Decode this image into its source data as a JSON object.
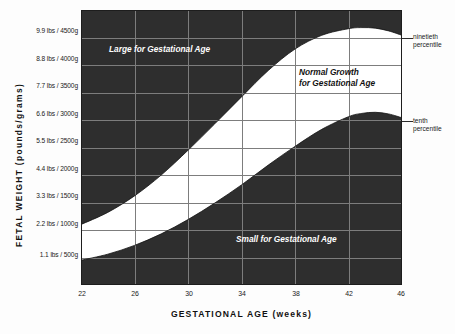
{
  "chart_data": {
    "type": "area",
    "title": "",
    "xlabel": "GESTATIONAL AGE (weeks)",
    "ylabel": "FETAL WEIGHT (pounds/grams)",
    "xlim": [
      22,
      46
    ],
    "ylim": [
      0,
      5000
    ],
    "grid": true,
    "legend_position": "right-annotations",
    "x_ticks": [
      22,
      26,
      30,
      34,
      38,
      42,
      46
    ],
    "x_tick_labels": [
      "22",
      "26",
      "30",
      "34",
      "38",
      "42",
      "46"
    ],
    "y_ticks": [
      500,
      1000,
      1500,
      2000,
      2500,
      3000,
      3500,
      4000,
      4500
    ],
    "y_tick_labels": [
      "1.1 lbs / 500g",
      "2.2 lbs / 1000g",
      "3.3 lbs / 1500g",
      "4.4 lbs / 2000g",
      "5.5 lbs / 2500g",
      "6.6 lbs / 3000g",
      "7.7 lbs / 3500g",
      "8.8 lbs / 4000g",
      "9.9 lbs / 4500g"
    ],
    "series": [
      {
        "name": "ninetieth percentile",
        "x": [
          22,
          24,
          26,
          28,
          30,
          32,
          34,
          36,
          38,
          40,
          42,
          43,
          44,
          45,
          46
        ],
        "values": [
          1100,
          1320,
          1620,
          2000,
          2450,
          2930,
          3420,
          3900,
          4290,
          4540,
          4660,
          4680,
          4670,
          4620,
          4540
        ]
      },
      {
        "name": "tenth percentile",
        "x": [
          22,
          24,
          26,
          28,
          30,
          32,
          34,
          36,
          38,
          40,
          42,
          43,
          44,
          45,
          46
        ],
        "values": [
          450,
          560,
          720,
          930,
          1190,
          1490,
          1820,
          2180,
          2520,
          2830,
          3060,
          3120,
          3140,
          3110,
          3040
        ]
      }
    ],
    "regions": [
      {
        "name": "Large for Gestational Age",
        "location": "above ninetieth percentile",
        "fill": "#2e2e2e",
        "text_color": "#ffffff"
      },
      {
        "name": "Normal Growth for Gestational Age",
        "location": "between tenth and ninetieth percentile",
        "fill": "#ffffff",
        "text_color": "#111111"
      },
      {
        "name": "Small for Gestational Age",
        "location": "below tenth percentile",
        "fill": "#2e2e2e",
        "text_color": "#ffffff"
      }
    ],
    "annotations": [
      {
        "label_line1": "ninetieth",
        "label_line2": "percentile",
        "points_to": "ninetieth percentile curve at 46 weeks"
      },
      {
        "label_line1": "tenth",
        "label_line2": "percentile",
        "points_to": "tenth percentile curve at 46 weeks"
      }
    ]
  },
  "axes": {
    "y_title": "FETAL WEIGHT (pounds/grams)",
    "x_title": "GESTATIONAL AGE (weeks)"
  },
  "zone_labels": {
    "large": "Large for Gestational Age",
    "normal_line1": "Normal Growth",
    "normal_line2": "for Gestational Age",
    "small": "Small for Gestational Age"
  },
  "annotations": {
    "ninetieth_line1": "ninetieth",
    "ninetieth_line2": "percentile",
    "tenth_line1": "tenth",
    "tenth_line2": "percentile"
  },
  "colors": {
    "dark_fill": "#2e2e2e",
    "light_fill": "#ffffff",
    "grid": "#777777",
    "text": "#1a1a1a",
    "background": "#fdfdfd"
  }
}
